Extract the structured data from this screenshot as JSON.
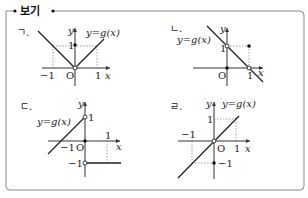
{
  "header": {
    "title": "보기"
  },
  "panels": [
    {
      "id": "a",
      "label": "ㄱ.",
      "func_label": "y=g(x)",
      "axis_x": "x",
      "axis_y": "y",
      "origin": "O",
      "ticks": {
        "x_neg": "−1",
        "x_pos": "1",
        "y_pos": "1"
      }
    },
    {
      "id": "b",
      "label": "ㄴ.",
      "func_label": "y=g(x)",
      "axis_x": "x",
      "axis_y": "y",
      "origin": "O",
      "ticks": {
        "x_pos": "1",
        "y_pos": "1"
      }
    },
    {
      "id": "c",
      "label": "ㄷ.",
      "func_label": "y=g(x)",
      "axis_x": "x",
      "axis_y": "y",
      "origin": "O",
      "ticks": {
        "x_neg": "−1",
        "x_pos": "1",
        "y_pos": "1",
        "y_neg": "−1"
      }
    },
    {
      "id": "d",
      "label": "ㄹ.",
      "func_label": "y=g(x)",
      "axis_x": "x",
      "axis_y": "y",
      "origin": "O",
      "ticks": {
        "x_neg": "−1",
        "x_pos": "1",
        "y_pos": "1",
        "y_neg": "−1"
      }
    }
  ],
  "colors": {
    "frame": "#8a8a8a",
    "ink": "#222222"
  }
}
